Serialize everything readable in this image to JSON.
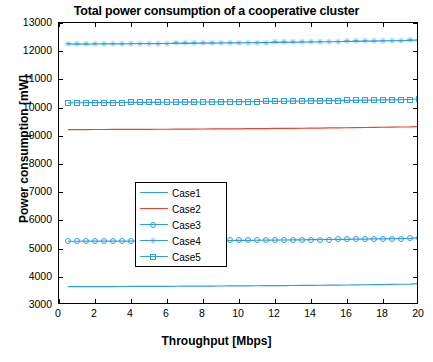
{
  "chart_data": {
    "type": "line",
    "title": "Total power consumption of a cooperative cluster",
    "xlabel": "Throughput [Mbps]",
    "ylabel": "Power consumption [mW]",
    "xlim": [
      0,
      20
    ],
    "ylim": [
      3000,
      13000
    ],
    "xticks": [
      0,
      2,
      4,
      6,
      8,
      10,
      12,
      14,
      16,
      18,
      20
    ],
    "yticks": [
      3000,
      4000,
      5000,
      6000,
      7000,
      8000,
      9000,
      10000,
      11000,
      12000,
      13000
    ],
    "grid": false,
    "legend_position": "center-left",
    "x": [
      0.5,
      1,
      1.5,
      2,
      2.5,
      3,
      3.5,
      4,
      4.5,
      5,
      5.5,
      6,
      6.5,
      7,
      7.5,
      8,
      8.5,
      9,
      9.5,
      10,
      10.5,
      11,
      11.5,
      12,
      12.5,
      13,
      13.5,
      14,
      14.5,
      15,
      15.5,
      16,
      16.5,
      17,
      17.5,
      18,
      18.5,
      19,
      19.5,
      20
    ],
    "series": [
      {
        "name": "Case1",
        "marker": "none",
        "color": "#2f9fe0",
        "values": [
          3650,
          3651,
          3652,
          3653,
          3654,
          3655,
          3656,
          3658,
          3659,
          3660,
          3662,
          3663,
          3665,
          3666,
          3668,
          3670,
          3672,
          3674,
          3676,
          3678,
          3680,
          3682,
          3685,
          3687,
          3690,
          3692,
          3695,
          3698,
          3701,
          3704,
          3707,
          3710,
          3714,
          3718,
          3722,
          3726,
          3730,
          3735,
          3740,
          3760
        ]
      },
      {
        "name": "Case2",
        "marker": "none",
        "color": "#e8452c",
        "values": [
          9220,
          9221,
          9222,
          9223,
          9224,
          9225,
          9226,
          9228,
          9229,
          9230,
          9232,
          9233,
          9235,
          9237,
          9239,
          9241,
          9243,
          9245,
          9247,
          9249,
          9252,
          9254,
          9257,
          9260,
          9262,
          9265,
          9268,
          9271,
          9275,
          9278,
          9282,
          9286,
          9290,
          9294,
          9298,
          9303,
          9307,
          9312,
          9317,
          9330
        ]
      },
      {
        "name": "Case3",
        "marker": "circle",
        "color": "#2f9fe0",
        "values": [
          5260,
          5261,
          5262,
          5263,
          5264,
          5265,
          5266,
          5268,
          5269,
          5270,
          5272,
          5274,
          5276,
          5278,
          5280,
          5282,
          5284,
          5286,
          5288,
          5291,
          5293,
          5296,
          5299,
          5302,
          5305,
          5308,
          5311,
          5315,
          5318,
          5322,
          5326,
          5330,
          5334,
          5338,
          5343,
          5347,
          5352,
          5357,
          5362,
          5390
        ]
      },
      {
        "name": "Case4",
        "marker": "star",
        "color": "#2f9fe0",
        "values": [
          12250,
          12252,
          12254,
          12256,
          12258,
          12260,
          12262,
          12264,
          12266,
          12268,
          12271,
          12273,
          12276,
          12278,
          12281,
          12284,
          12287,
          12290,
          12293,
          12296,
          12300,
          12303,
          12307,
          12310,
          12314,
          12318,
          12322,
          12326,
          12330,
          12335,
          12339,
          12344,
          12349,
          12354,
          12359,
          12364,
          12370,
          12375,
          12381,
          12400
        ]
      },
      {
        "name": "Case5",
        "marker": "square",
        "color": "#2f9fe0",
        "values": [
          10170,
          10172,
          10173,
          10175,
          10176,
          10178,
          10180,
          10182,
          10184,
          10186,
          10188,
          10190,
          10192,
          10194,
          10197,
          10199,
          10202,
          10205,
          10207,
          10210,
          10213,
          10216,
          10219,
          10223,
          10226,
          10230,
          10233,
          10237,
          10241,
          10245,
          10249,
          10253,
          10258,
          10262,
          10267,
          10272,
          10277,
          10282,
          10287,
          10310
        ]
      }
    ],
    "legend_entries": [
      "Case1",
      "Case2",
      "Case3",
      "Case4",
      "Case5"
    ]
  }
}
